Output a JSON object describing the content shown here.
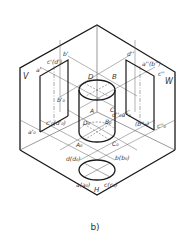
{
  "figure": {
    "caption": "b)",
    "colors": {
      "stroke": "#1a1a1a",
      "thin": "#555555",
      "label": "#333333",
      "background": "#ffffff"
    },
    "planes": {
      "v": "V",
      "w": "W",
      "h": "H"
    },
    "labels": {
      "a_prime": "a'",
      "c_prime_d_prime": "c'(d')",
      "b_prime": "b'",
      "b0_prime": "b'₀",
      "a0_prime": "a'₀",
      "c0_prime_d0_prime": "c'₀(d'₀)",
      "d_dprime": "d''",
      "a_dprime_b_dprime": "a''(b'')",
      "c_dprime": "c''",
      "d0_dprime_a0_dprime": "d''₀a''₀",
      "b0_dprime": "(b''₀)",
      "c0_dprime": "c''₀",
      "D": "D",
      "B": "B",
      "A": "A",
      "C": "C",
      "D0": "D₀",
      "B0": "B₀",
      "A0": "A₀",
      "C0": "C₀",
      "d_d0": "d(d₀)",
      "b_b0": "b(b₀)",
      "a_a0": "a(a₀)",
      "c_c0": "c(c₀)"
    }
  }
}
